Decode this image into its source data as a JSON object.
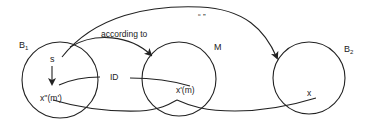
{
  "diagram": {
    "sets": [
      {
        "id": "B1",
        "label": "B",
        "subscript": "1",
        "cx": 60,
        "cy": 80,
        "r": 38
      },
      {
        "id": "M",
        "label": "M",
        "subscript": "",
        "cx": 179,
        "cy": 79,
        "r": 37
      },
      {
        "id": "B2",
        "label": "B",
        "subscript": "2",
        "cx": 309,
        "cy": 78,
        "r": 36
      }
    ],
    "elements": {
      "s": "s",
      "x_double_prime": "x''(m')",
      "x_prime": "x'(m)",
      "x": "x"
    },
    "edges": {
      "according_to": "according to",
      "id": "ID",
      "quote": "“  ”"
    },
    "colors": {
      "line": "#222222",
      "background": "#ffffff"
    }
  }
}
